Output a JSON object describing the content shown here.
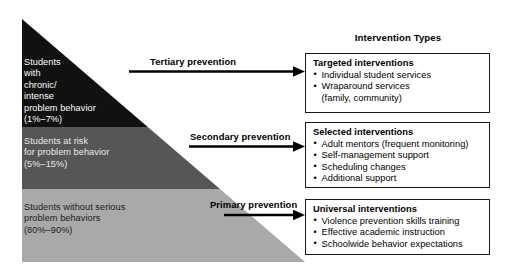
{
  "heading": "Intervention Types",
  "pyramid": {
    "tiers": [
      {
        "name": "tertiary",
        "text": "Students\nwith\nchronic/\nintense\nproblem behavior\n(1%–7%)",
        "color": "#111111"
      },
      {
        "name": "secondary",
        "text": "Students at risk\nfor problem behavior\n(5%–15%)",
        "color": "#565656"
      },
      {
        "name": "primary",
        "text": "Students without serious\nproblem behaviors\n(80%–90%)",
        "color": "#a9a9a9"
      }
    ]
  },
  "arrows": [
    {
      "name": "tertiary-prevention",
      "label": "Tertiary prevention"
    },
    {
      "name": "secondary-prevention",
      "label": "Secondary prevention"
    },
    {
      "name": "primary-prevention",
      "label": "Primary prevention"
    }
  ],
  "boxes": [
    {
      "name": "targeted",
      "title": "Targeted interventions",
      "items": [
        {
          "text": "Individual student services",
          "continuation": false
        },
        {
          "text": "Wraparound services",
          "continuation": false
        },
        {
          "text": "(family, community)",
          "continuation": true
        }
      ]
    },
    {
      "name": "selected",
      "title": "Selected interventions",
      "items": [
        {
          "text": "Adult mentors (frequent monitoring)",
          "continuation": false
        },
        {
          "text": "Self-management support",
          "continuation": false
        },
        {
          "text": "Scheduling changes",
          "continuation": false
        },
        {
          "text": "Additional support",
          "continuation": false
        }
      ]
    },
    {
      "name": "universal",
      "title": "Universal interventions",
      "items": [
        {
          "text": "Violence prevention skills training",
          "continuation": false
        },
        {
          "text": "Effective academic instruction",
          "continuation": false
        },
        {
          "text": "Schoolwide behavior expectations",
          "continuation": false
        }
      ]
    }
  ],
  "colors": {
    "tier_tertiary": "#111111",
    "tier_secondary": "#565656",
    "tier_primary": "#a9a9a9",
    "arrow": "#000000",
    "box_border": "#1a1a1a",
    "background": "#ffffff"
  }
}
